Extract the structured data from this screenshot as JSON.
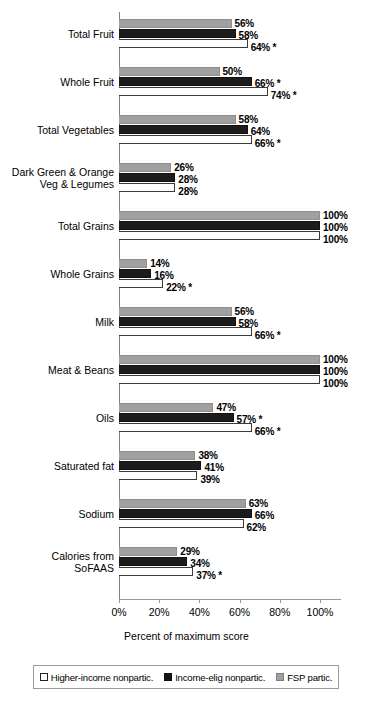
{
  "chart_data": {
    "type": "bar",
    "orientation": "horizontal",
    "title": "",
    "xlabel": "Percent of maximum score",
    "ylabel": "",
    "xlim": [
      0,
      100
    ],
    "xticks": [
      "0%",
      "20%",
      "40%",
      "60%",
      "80%",
      "100%"
    ],
    "xtick_values": [
      0,
      20,
      40,
      60,
      80,
      100
    ],
    "grid": false,
    "legend_position": "bottom",
    "categories": [
      "Total Fruit",
      "Whole Fruit",
      "Total Vegetables",
      "Dark Green & Orange\nVeg & Legumes",
      "Total Grains",
      "Whole Grains",
      "Milk",
      "Meat & Beans",
      "Oils",
      "Saturated fat",
      "Sodium",
      "Calories from\nSoFAAS"
    ],
    "series": [
      {
        "name": "FSP partic.",
        "key": "fsp",
        "color": "#a0a0a0",
        "values": [
          56,
          50,
          58,
          26,
          100,
          14,
          56,
          100,
          47,
          38,
          63,
          29
        ],
        "labels": [
          "56%",
          "50%",
          "58%",
          "26%",
          "100%",
          "14%",
          "56%",
          "100%",
          "47%",
          "38%",
          "63%",
          "29%"
        ]
      },
      {
        "name": "Income-elig nonpartic.",
        "key": "ien",
        "color": "#1c1c1c",
        "values": [
          58,
          66,
          64,
          28,
          100,
          16,
          58,
          100,
          57,
          41,
          66,
          34
        ],
        "labels": [
          "58%",
          "66% *",
          "64%",
          "28%",
          "100%",
          "16%",
          "58%",
          "100%",
          "57% *",
          "41%",
          "66%",
          "34%"
        ]
      },
      {
        "name": "Higher-income nonpartic.",
        "key": "hin",
        "color": "#ffffff",
        "values": [
          64,
          74,
          66,
          28,
          100,
          22,
          66,
          100,
          66,
          39,
          62,
          37
        ],
        "labels": [
          "64% *",
          "74% *",
          "66% *",
          "28%",
          "100%",
          "22% *",
          "66% *",
          "100%",
          "66% *",
          "39%",
          "62%",
          "37% *"
        ]
      }
    ],
    "legend": [
      {
        "label": "Higher-income nonpartic.",
        "key": "hin"
      },
      {
        "label": "Income-elig nonpartic.",
        "key": "ien"
      },
      {
        "label": "FSP partic.",
        "key": "fsp"
      }
    ],
    "footnote_marker": "*"
  }
}
